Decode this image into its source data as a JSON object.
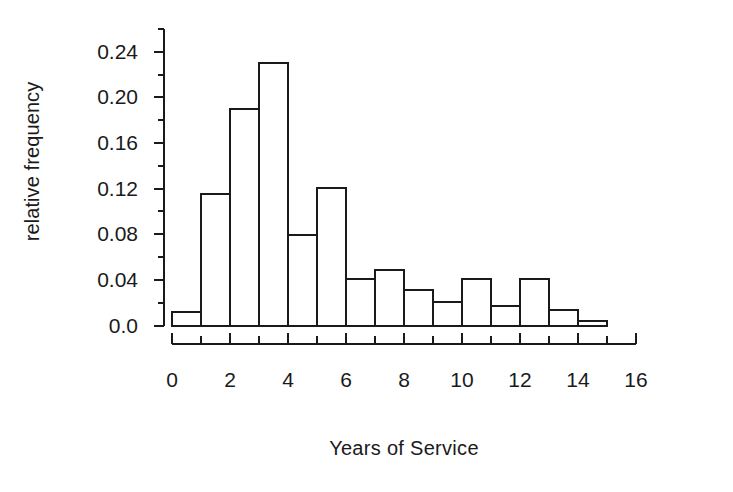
{
  "chart_data": {
    "type": "bar",
    "title": "",
    "subtitle": "",
    "xlabel": "Years of Service",
    "ylabel": "relative frequency",
    "xlim": [
      0,
      16
    ],
    "ylim": [
      0.0,
      0.26
    ],
    "grid": false,
    "legend": null,
    "bar_style": {
      "fill": "#ffffff",
      "edge": "#1a1a1a",
      "edge_width": 2
    },
    "axis_color": "#1a1a1a",
    "bin_width": 1,
    "bins": [
      {
        "x0": 0,
        "x1": 1,
        "value": 0.012
      },
      {
        "x0": 1,
        "x1": 2,
        "value": 0.115
      },
      {
        "x0": 2,
        "x1": 3,
        "value": 0.19
      },
      {
        "x0": 3,
        "x1": 4,
        "value": 0.23
      },
      {
        "x0": 4,
        "x1": 5,
        "value": 0.079
      },
      {
        "x0": 5,
        "x1": 6,
        "value": 0.121
      },
      {
        "x0": 6,
        "x1": 7,
        "value": 0.041
      },
      {
        "x0": 7,
        "x1": 8,
        "value": 0.049
      },
      {
        "x0": 8,
        "x1": 9,
        "value": 0.031
      },
      {
        "x0": 9,
        "x1": 10,
        "value": 0.021
      },
      {
        "x0": 10,
        "x1": 11,
        "value": 0.041
      },
      {
        "x0": 11,
        "x1": 12,
        "value": 0.017
      },
      {
        "x0": 12,
        "x1": 13,
        "value": 0.041
      },
      {
        "x0": 13,
        "x1": 14,
        "value": 0.014
      },
      {
        "x0": 14,
        "x1": 15,
        "value": 0.004
      }
    ],
    "categories": [
      "0-1",
      "1-2",
      "2-3",
      "3-4",
      "4-5",
      "5-6",
      "6-7",
      "7-8",
      "8-9",
      "9-10",
      "10-11",
      "11-12",
      "12-13",
      "13-14",
      "14-15"
    ],
    "values": [
      0.012,
      0.115,
      0.19,
      0.23,
      0.079,
      0.121,
      0.041,
      0.049,
      0.031,
      0.021,
      0.041,
      0.017,
      0.041,
      0.014,
      0.004
    ],
    "yticks_major": [
      0.0,
      0.04,
      0.08,
      0.12,
      0.16,
      0.2,
      0.24
    ],
    "ytick_labels": [
      "0.0",
      "0.04",
      "0.08",
      "0.12",
      "0.16",
      "0.20",
      "0.24"
    ],
    "yticks_minor": [
      0.02,
      0.06,
      0.1,
      0.14,
      0.18,
      0.22,
      0.26
    ],
    "xticks_major": [
      0,
      2,
      4,
      6,
      8,
      10,
      12,
      14,
      16
    ],
    "xtick_labels": [
      "0",
      "2",
      "4",
      "6",
      "8",
      "10",
      "12",
      "14",
      "16"
    ],
    "xticks_minor": [
      1,
      3,
      5,
      7,
      9,
      11,
      13,
      15
    ]
  }
}
